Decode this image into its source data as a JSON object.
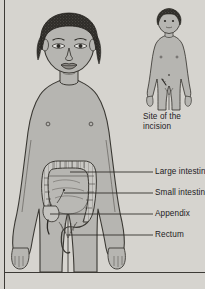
{
  "figure": {
    "background_color": "#d6d4cf",
    "skin_fill": "#b6b5b1",
    "outline_color": "#3a3833",
    "hair_color": "#2e2c28",
    "organ_fill": "#c9c8c4",
    "leader_line_color": "#2b2925"
  },
  "labels": {
    "site_of_incision": "Site of the incision",
    "large_intestine": "Large intestine",
    "small_intestine": "Small intestine",
    "appendix": "Appendix",
    "rectum": "Rectum"
  },
  "caption": {
    "partial_text": ""
  },
  "inset": {
    "name": "incision-site-inset",
    "description": "Small standing child figure showing incision mark on lower right abdomen"
  },
  "main_figure": {
    "name": "child-torso-figure",
    "description": "Front view of a child from head to mid-thigh with intestines overlaid"
  }
}
